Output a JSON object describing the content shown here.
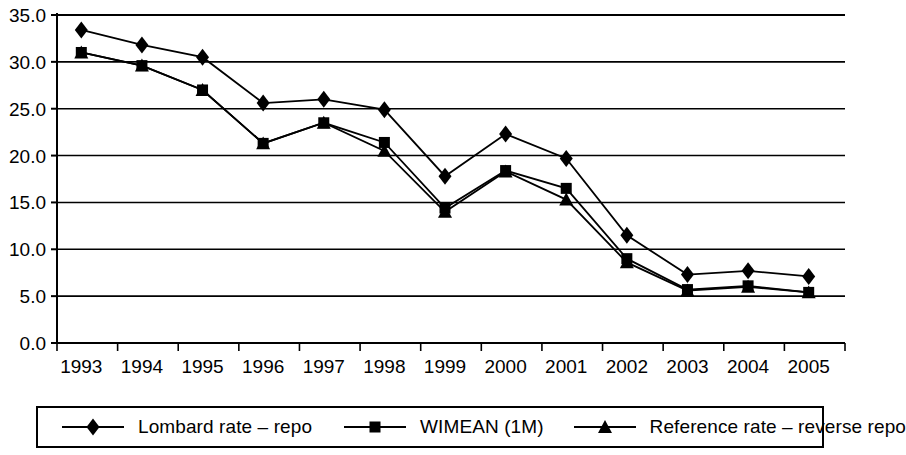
{
  "chart_data": {
    "type": "line",
    "title": "",
    "subtitle": "",
    "xlabel": "",
    "ylabel": "",
    "categories": [
      "1993",
      "1994",
      "1995",
      "1996",
      "1997",
      "1998",
      "1999",
      "2000",
      "2001",
      "2002",
      "2003",
      "2004",
      "2005"
    ],
    "x": [
      1993,
      1994,
      1995,
      1996,
      1997,
      1998,
      1999,
      2000,
      2001,
      2002,
      2003,
      2004,
      2005
    ],
    "series": [
      {
        "name": "Lombard rate – repo",
        "marker": "diamond",
        "values": [
          33.4,
          31.8,
          30.5,
          25.6,
          26.0,
          24.9,
          17.8,
          22.3,
          19.7,
          11.5,
          7.3,
          7.7,
          7.1
        ]
      },
      {
        "name": "WIMEAN (1M)",
        "marker": "square",
        "values": [
          31.0,
          29.6,
          27.0,
          21.3,
          23.5,
          21.4,
          14.4,
          18.4,
          16.5,
          9.0,
          5.7,
          6.1,
          5.4
        ]
      },
      {
        "name": "Reference rate – reverse repo",
        "marker": "triangle",
        "values": [
          31.0,
          29.6,
          27.0,
          21.3,
          23.5,
          20.5,
          14.0,
          18.3,
          15.3,
          8.6,
          5.6,
          6.0,
          5.4
        ]
      }
    ],
    "ylim": [
      0.0,
      35.0
    ],
    "ytick_step": 5.0,
    "ytick_labels": [
      "0.0",
      "5.0",
      "10.0",
      "15.0",
      "20.0",
      "25.0",
      "30.0",
      "35.0"
    ],
    "ytick_values": [
      0.0,
      5.0,
      10.0,
      15.0,
      20.0,
      25.0,
      30.0,
      35.0
    ],
    "grid": "horizontal",
    "legend_position": "bottom",
    "line_color": "#000000",
    "grid_color": "#000000",
    "background_color": "#ffffff"
  },
  "legend": {
    "entries": [
      {
        "label": "Lombard rate – repo",
        "marker": "diamond"
      },
      {
        "label": "WIMEAN (1M)",
        "marker": "square"
      },
      {
        "label": "Reference rate – reverse repo",
        "marker": "triangle"
      }
    ]
  }
}
